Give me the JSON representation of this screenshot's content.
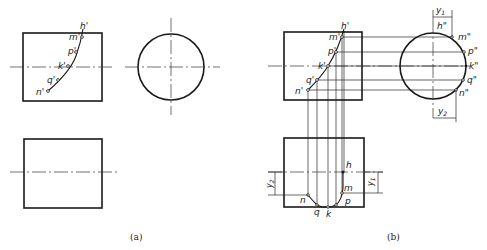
{
  "figure": {
    "panels": [
      {
        "id": "a",
        "caption": "(a)",
        "front_view_labels": [
          "h'",
          "m'",
          "p'",
          "k'",
          "q'",
          "n'"
        ]
      },
      {
        "id": "b",
        "caption": "(b)",
        "front_view_labels": [
          "h'",
          "m'",
          "p'",
          "k'",
          "q'",
          "n'"
        ],
        "side_view_labels": [
          "h\"",
          "m\"",
          "p\"",
          "k\"",
          "q\"",
          "n\""
        ],
        "top_view_labels": [
          "h",
          "m",
          "p",
          "k",
          "q",
          "n"
        ],
        "dimensions": [
          "y1",
          "y2"
        ]
      }
    ]
  },
  "labels": {
    "a_h": "h'",
    "a_m": "m'",
    "a_p": "p'",
    "a_k": "k'",
    "a_q": "q'",
    "a_n": "n'",
    "b_h": "h'",
    "b_m": "m'",
    "b_p": "p'",
    "b_k": "k'",
    "b_q": "q'",
    "b_n": "n'",
    "b_h2": "h\"",
    "b_m2": "m\"",
    "b_p2": "p\"",
    "b_k2": "k\"",
    "b_q2": "q\"",
    "b_n2": "n\"",
    "b_h1": "h",
    "b_m1": "m",
    "b_p1": "p",
    "b_k1": "k",
    "b_q1": "q",
    "b_n1": "n",
    "y1": "y",
    "y1_sub": "1",
    "y2": "y",
    "y2_sub": "2",
    "caption_a": "(a)",
    "caption_b": "(b)"
  }
}
